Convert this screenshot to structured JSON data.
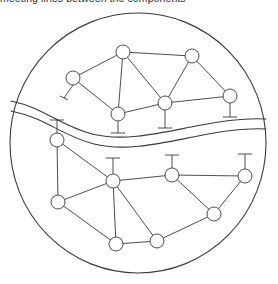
{
  "figure": {
    "caption_clipped": "meeting lines between the components",
    "width": 278,
    "height": 284,
    "background_color": "#ffffff",
    "stroke_color": "#3a3a3a",
    "node_fill_color": "#ffffff"
  },
  "boundary": {
    "label": "outer-circle",
    "center_x": 138,
    "center_y": 143,
    "radius_x": 128,
    "radius_y": 130,
    "stroke_width": 1.1
  },
  "divider": {
    "label": "wavy-band",
    "description": "Two nearly parallel wavy curves crossing the disc from left edge to right edge, separating the upper network from the lower network.",
    "upper_curve": "M 11,101 C 45,108 60,126 92,134 C 124,142 160,133 196,126 C 226,120 248,118 266,119",
    "lower_curve": "M 11,111 C 46,118 62,136 94,144 C 126,152 162,143 198,136 C 228,130 249,128 266,129",
    "stroke_width": 1.1
  },
  "upper_network": {
    "label": "upper-network",
    "node_radius": 7,
    "nodes": [
      {
        "id": "u1",
        "name": "node-u1",
        "x": 123,
        "y": 52,
        "stub": "none"
      },
      {
        "id": "u2",
        "name": "node-u2",
        "x": 192,
        "y": 56,
        "stub": "none"
      },
      {
        "id": "u3",
        "name": "node-u3",
        "x": 73,
        "y": 78,
        "stub": "down-left"
      },
      {
        "id": "u4",
        "name": "node-u4",
        "x": 230,
        "y": 96,
        "stub": "down-t"
      },
      {
        "id": "u5",
        "name": "node-u5",
        "x": 118,
        "y": 114,
        "stub": "down-t"
      },
      {
        "id": "u6",
        "name": "node-u6",
        "x": 165,
        "y": 103,
        "stub": "down-t"
      }
    ],
    "edges": [
      {
        "from": "u3",
        "to": "u1"
      },
      {
        "from": "u1",
        "to": "u2"
      },
      {
        "from": "u1",
        "to": "u5"
      },
      {
        "from": "u1",
        "to": "u6"
      },
      {
        "from": "u2",
        "to": "u6"
      },
      {
        "from": "u2",
        "to": "u4"
      },
      {
        "from": "u3",
        "to": "u5"
      },
      {
        "from": "u5",
        "to": "u6"
      },
      {
        "from": "u6",
        "to": "u4"
      }
    ],
    "stubs": [
      {
        "node": "u3",
        "name": "stub-u3",
        "x1": 73,
        "y1": 85,
        "x2": 64,
        "y2": 98,
        "cap": "slash",
        "cap_x1": 60,
        "cap_y1": 96,
        "cap_x2": 68,
        "cap_y2": 100
      },
      {
        "node": "u4",
        "name": "stub-u4",
        "x1": 230,
        "y1": 103,
        "x2": 230,
        "y2": 117,
        "cap": "bar",
        "cap_x1": 223,
        "cap_y1": 117,
        "cap_x2": 237,
        "cap_y2": 117
      },
      {
        "node": "u5",
        "name": "stub-u5",
        "x1": 118,
        "y1": 121,
        "x2": 118,
        "y2": 133,
        "cap": "bar",
        "cap_x1": 111,
        "cap_y1": 133,
        "cap_x2": 125,
        "cap_y2": 133
      },
      {
        "node": "u6",
        "name": "stub-u6",
        "x1": 165,
        "y1": 110,
        "x2": 165,
        "y2": 128,
        "cap": "bar",
        "cap_x1": 158,
        "cap_y1": 128,
        "cap_x2": 172,
        "cap_y2": 128
      }
    ]
  },
  "lower_network": {
    "label": "lower-network",
    "node_radius": 7,
    "nodes": [
      {
        "id": "l1",
        "name": "node-l1",
        "x": 57,
        "y": 140,
        "stub": "up-t"
      },
      {
        "id": "l2",
        "name": "node-l2",
        "x": 113,
        "y": 181,
        "stub": "up-t"
      },
      {
        "id": "l3",
        "name": "node-l3",
        "x": 172,
        "y": 175,
        "stub": "up-t"
      },
      {
        "id": "l4",
        "name": "node-l4",
        "x": 245,
        "y": 176,
        "stub": "up-t"
      },
      {
        "id": "l5",
        "name": "node-l5",
        "x": 58,
        "y": 202,
        "stub": "none"
      },
      {
        "id": "l6",
        "name": "node-l6",
        "x": 214,
        "y": 214,
        "stub": "none"
      },
      {
        "id": "l7",
        "name": "node-l7",
        "x": 116,
        "y": 244,
        "stub": "none"
      },
      {
        "id": "l8",
        "name": "node-l8",
        "x": 157,
        "y": 241,
        "stub": "none"
      }
    ],
    "edges": [
      {
        "from": "l1",
        "to": "l2"
      },
      {
        "from": "l1",
        "to": "l5"
      },
      {
        "from": "l2",
        "to": "l5"
      },
      {
        "from": "l2",
        "to": "l3"
      },
      {
        "from": "l2",
        "to": "l7"
      },
      {
        "from": "l2",
        "to": "l8"
      },
      {
        "from": "l3",
        "to": "l4"
      },
      {
        "from": "l3",
        "to": "l6"
      },
      {
        "from": "l4",
        "to": "l6"
      },
      {
        "from": "l5",
        "to": "l7"
      },
      {
        "from": "l6",
        "to": "l8"
      },
      {
        "from": "l7",
        "to": "l8"
      }
    ],
    "stubs": [
      {
        "node": "l1",
        "name": "stub-l1",
        "x1": 57,
        "y1": 133,
        "x2": 57,
        "y2": 120,
        "cap": "bar",
        "cap_x1": 50,
        "cap_y1": 120,
        "cap_x2": 64,
        "cap_y2": 120
      },
      {
        "node": "l2",
        "name": "stub-l2",
        "x1": 113,
        "y1": 174,
        "x2": 113,
        "y2": 158,
        "cap": "bar",
        "cap_x1": 106,
        "cap_y1": 158,
        "cap_x2": 120,
        "cap_y2": 158
      },
      {
        "node": "l3",
        "name": "stub-l3",
        "x1": 172,
        "y1": 168,
        "x2": 172,
        "y2": 155,
        "cap": "bar",
        "cap_x1": 165,
        "cap_y1": 155,
        "cap_x2": 179,
        "cap_y2": 155
      },
      {
        "node": "l4",
        "name": "stub-l4",
        "x1": 245,
        "y1": 169,
        "x2": 245,
        "y2": 154,
        "cap": "bar",
        "cap_x1": 238,
        "cap_y1": 154,
        "cap_x2": 252,
        "cap_y2": 154
      }
    ]
  }
}
